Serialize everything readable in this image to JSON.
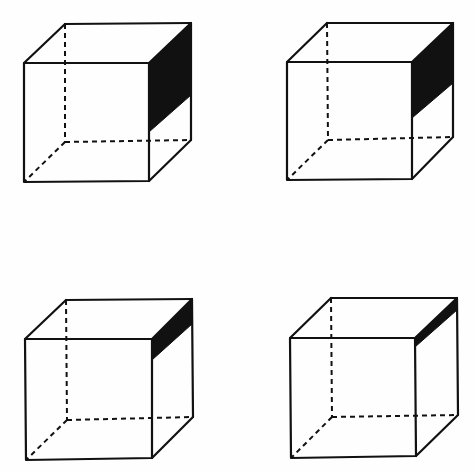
{
  "figure": {
    "line_color": "#111111",
    "background": "#fefefe",
    "cubes": [
      {
        "id": "top-left",
        "front": [
          [
            24,
            63
          ],
          [
            149,
            63
          ],
          [
            149,
            181
          ],
          [
            24,
            182
          ]
        ],
        "back": [
          [
            65,
            24
          ],
          [
            191,
            23
          ],
          [
            191,
            140
          ],
          [
            65,
            142
          ]
        ],
        "shade": [
          [
            149,
            63
          ],
          [
            191,
            23
          ],
          [
            191,
            95
          ],
          [
            149,
            132
          ]
        ]
      },
      {
        "id": "top-right",
        "front": [
          [
            287,
            62
          ],
          [
            412,
            62
          ],
          [
            412,
            179
          ],
          [
            287,
            180
          ]
        ],
        "back": [
          [
            327,
            23
          ],
          [
            453,
            23
          ],
          [
            453,
            137
          ],
          [
            328,
            140
          ]
        ],
        "shade": [
          [
            412,
            62
          ],
          [
            453,
            23
          ],
          [
            453,
            83
          ],
          [
            412,
            118
          ]
        ]
      },
      {
        "id": "bottom-left",
        "front": [
          [
            25,
            339
          ],
          [
            152,
            339
          ],
          [
            152,
            458
          ],
          [
            26,
            460
          ]
        ],
        "back": [
          [
            66,
            300
          ],
          [
            192,
            299
          ],
          [
            193,
            417
          ],
          [
            67,
            420
          ]
        ],
        "shade": [
          [
            152,
            339
          ],
          [
            192,
            299
          ],
          [
            192,
            324
          ],
          [
            152,
            360
          ]
        ]
      },
      {
        "id": "bottom-right",
        "front": [
          [
            290,
            338
          ],
          [
            415,
            338
          ],
          [
            416,
            456
          ],
          [
            291,
            458
          ]
        ],
        "back": [
          [
            331,
            298
          ],
          [
            457,
            298
          ],
          [
            458,
            415
          ],
          [
            332,
            417
          ]
        ],
        "shade": [
          [
            415,
            338
          ],
          [
            457,
            298
          ],
          [
            457,
            310
          ],
          [
            415,
            347
          ]
        ]
      }
    ]
  }
}
